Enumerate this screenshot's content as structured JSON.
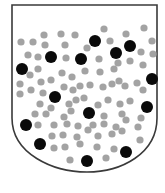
{
  "diagram": {
    "shape": "shield",
    "colors": {
      "background": "#ffffff",
      "outline": "#3a3a3a",
      "grey_dot": "#a3a3a3",
      "black_dot": "#0a0a0a"
    },
    "shield": {
      "top_y": 5,
      "left_x": 12,
      "right_x": 157,
      "straight_to_y": 118,
      "tip_x": 87,
      "tip_y": 172
    },
    "black_dots": [
      {
        "x": 22,
        "y": 69,
        "r": 6
      },
      {
        "x": 51,
        "y": 57,
        "r": 6
      },
      {
        "x": 81,
        "y": 59,
        "r": 6
      },
      {
        "x": 95,
        "y": 41,
        "r": 6
      },
      {
        "x": 116,
        "y": 53,
        "r": 6
      },
      {
        "x": 130,
        "y": 46,
        "r": 6
      },
      {
        "x": 152,
        "y": 79,
        "r": 6
      },
      {
        "x": 55,
        "y": 97,
        "r": 6
      },
      {
        "x": 89,
        "y": 113,
        "r": 6
      },
      {
        "x": 147,
        "y": 107,
        "r": 6
      },
      {
        "x": 26,
        "y": 125,
        "r": 6
      },
      {
        "x": 40,
        "y": 144,
        "r": 6
      },
      {
        "x": 126,
        "y": 152,
        "r": 6
      },
      {
        "x": 87,
        "y": 161,
        "r": 6
      }
    ],
    "grey_dots": [
      {
        "x": 21,
        "y": 42
      },
      {
        "x": 33,
        "y": 42
      },
      {
        "x": 44,
        "y": 35
      },
      {
        "x": 61,
        "y": 34
      },
      {
        "x": 75,
        "y": 35
      },
      {
        "x": 104,
        "y": 29
      },
      {
        "x": 126,
        "y": 34
      },
      {
        "x": 144,
        "y": 28
      },
      {
        "x": 152,
        "y": 41
      },
      {
        "x": 45,
        "y": 45
      },
      {
        "x": 65,
        "y": 45
      },
      {
        "x": 87,
        "y": 48
      },
      {
        "x": 110,
        "y": 41
      },
      {
        "x": 141,
        "y": 52
      },
      {
        "x": 153,
        "y": 54
      },
      {
        "x": 28,
        "y": 55
      },
      {
        "x": 38,
        "y": 57
      },
      {
        "x": 66,
        "y": 58
      },
      {
        "x": 99,
        "y": 59
      },
      {
        "x": 130,
        "y": 61
      },
      {
        "x": 143,
        "y": 65
      },
      {
        "x": 38,
        "y": 69
      },
      {
        "x": 30,
        "y": 75
      },
      {
        "x": 62,
        "y": 73
      },
      {
        "x": 72,
        "y": 77
      },
      {
        "x": 85,
        "y": 71
      },
      {
        "x": 100,
        "y": 72
      },
      {
        "x": 114,
        "y": 69
      },
      {
        "x": 118,
        "y": 63
      },
      {
        "x": 119,
        "y": 81
      },
      {
        "x": 137,
        "y": 83
      },
      {
        "x": 20,
        "y": 84
      },
      {
        "x": 41,
        "y": 82
      },
      {
        "x": 51,
        "y": 80
      },
      {
        "x": 20,
        "y": 94
      },
      {
        "x": 31,
        "y": 90
      },
      {
        "x": 43,
        "y": 93
      },
      {
        "x": 64,
        "y": 87
      },
      {
        "x": 73,
        "y": 90
      },
      {
        "x": 80,
        "y": 86
      },
      {
        "x": 90,
        "y": 85
      },
      {
        "x": 103,
        "y": 87
      },
      {
        "x": 112,
        "y": 84
      },
      {
        "x": 125,
        "y": 86
      },
      {
        "x": 143,
        "y": 90
      },
      {
        "x": 40,
        "y": 104
      },
      {
        "x": 51,
        "y": 108
      },
      {
        "x": 69,
        "y": 104
      },
      {
        "x": 76,
        "y": 100
      },
      {
        "x": 84,
        "y": 98
      },
      {
        "x": 98,
        "y": 105
      },
      {
        "x": 108,
        "y": 100
      },
      {
        "x": 120,
        "y": 104
      },
      {
        "x": 130,
        "y": 101
      },
      {
        "x": 35,
        "y": 114
      },
      {
        "x": 46,
        "y": 114
      },
      {
        "x": 64,
        "y": 117
      },
      {
        "x": 71,
        "y": 111
      },
      {
        "x": 104,
        "y": 116
      },
      {
        "x": 122,
        "y": 114
      },
      {
        "x": 141,
        "y": 118
      },
      {
        "x": 38,
        "y": 125
      },
      {
        "x": 54,
        "y": 125
      },
      {
        "x": 67,
        "y": 124
      },
      {
        "x": 78,
        "y": 126
      },
      {
        "x": 93,
        "y": 125
      },
      {
        "x": 104,
        "y": 124
      },
      {
        "x": 116,
        "y": 127
      },
      {
        "x": 126,
        "y": 120
      },
      {
        "x": 52,
        "y": 136
      },
      {
        "x": 63,
        "y": 135
      },
      {
        "x": 77,
        "y": 137
      },
      {
        "x": 88,
        "y": 130
      },
      {
        "x": 98,
        "y": 136
      },
      {
        "x": 112,
        "y": 134
      },
      {
        "x": 122,
        "y": 131
      },
      {
        "x": 138,
        "y": 127
      },
      {
        "x": 54,
        "y": 148
      },
      {
        "x": 65,
        "y": 147
      },
      {
        "x": 80,
        "y": 144
      },
      {
        "x": 97,
        "y": 147
      },
      {
        "x": 114,
        "y": 149
      },
      {
        "x": 140,
        "y": 140
      },
      {
        "x": 70,
        "y": 160
      },
      {
        "x": 106,
        "y": 158
      }
    ]
  }
}
